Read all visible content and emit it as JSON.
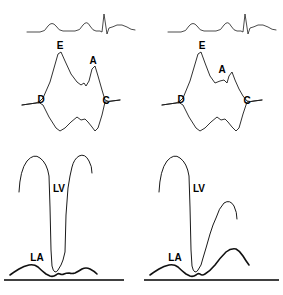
{
  "figure": {
    "background_color": "#ffffff",
    "trace_color": "#1a1a1a",
    "baseline_color": "#000000",
    "width": 283,
    "height": 295
  },
  "panels": [
    {
      "id": "top-left",
      "name": "mitral-m-mode-left",
      "description": "ECG with mitral valve M-mode tracing, normal pattern",
      "labels": [
        {
          "text": "E",
          "x": 60,
          "y": 46
        },
        {
          "text": "A",
          "x": 93,
          "y": 61
        },
        {
          "text": "D",
          "x": 41,
          "y": 100
        },
        {
          "text": "C",
          "x": 106,
          "y": 101
        }
      ]
    },
    {
      "id": "top-right",
      "name": "mitral-m-mode-right",
      "description": "ECG with mitral valve M-mode tracing, abnormal pattern",
      "labels": [
        {
          "text": "E",
          "x": 202,
          "y": 46
        },
        {
          "text": "A",
          "x": 222,
          "y": 70
        },
        {
          "text": "D",
          "x": 181,
          "y": 100
        },
        {
          "text": "C",
          "x": 247,
          "y": 101
        }
      ]
    },
    {
      "id": "bottom-left",
      "name": "pressure-tracing-left",
      "description": "LV and LA pressure tracings, normal LA pressure",
      "labels": [
        {
          "text": "LV",
          "x": 59,
          "y": 189
        },
        {
          "text": "LA",
          "x": 37,
          "y": 258
        }
      ]
    },
    {
      "id": "bottom-right",
      "name": "pressure-tracing-right",
      "description": "LV and LA pressure tracings, elevated LA v wave",
      "labels": [
        {
          "text": "LV",
          "x": 199,
          "y": 189
        },
        {
          "text": "LA",
          "x": 175,
          "y": 258
        }
      ]
    }
  ],
  "chart_data": {
    "type": "line",
    "xlabel": "",
    "ylabel": "",
    "grid": false,
    "legend": "none",
    "panel_count": 4,
    "series": [
      {
        "name": "ecg-left",
        "panel": "top-left",
        "description": "Surface ECG: P wave, second P wave, QRS spike, T wave",
        "path": "M 27,32 L 40,32 Q 45,32 48,26 Q 52,21 56,26 Q 59,31 63,31 L 75,31 Q 80,31 83,25 Q 87,20 90,26 Q 93,31 96,31 L 100,31 L 102,32 L 104,14 L 107,34 L 109,28 Q 113,27 117,25 Q 122,24 127,27 Q 131,30 135,30"
      },
      {
        "name": "mitral-anterior-leaflet-left",
        "panel": "top-left",
        "description": "Anterior mitral leaflet M-mode: D, E, F, A, C points (normal, wide EF slope)",
        "path": "M 22,105 L 36,103 Q 40,102 43,98 L 50,82 L 58,54 L 61,52 L 65,61 L 71,74 L 77,82 L 81,85 L 84,83 L 86,86 L 89,81 L 92,69 L 95,66 L 98,76 L 102,90 L 105,100 Q 108,102 112,101 L 120,100"
      },
      {
        "name": "mitral-posterior-leaflet-left",
        "panel": "top-left",
        "description": "Posterior mitral leaflet M-mode, mirror image",
        "path": "M 22,105 L 36,103 Q 40,102 43,105 L 49,117 L 56,128 L 60,131 L 65,128 L 71,122 L 77,117 L 81,120 L 85,119 L 88,122 L 92,127 L 95,131 L 98,128 L 102,115 L 105,102 Q 108,102 112,101 L 120,100"
      },
      {
        "name": "ecg-right",
        "panel": "top-right",
        "description": "Surface ECG: P wave, second P wave, QRS spike, T wave",
        "path": "M 168,32 L 181,32 Q 186,32 189,26 Q 193,21 197,26 Q 200,31 204,31 L 216,31 Q 221,31 224,25 Q 228,20 231,26 Q 234,31 237,31 L 241,31 L 243,32 L 245,14 L 248,34 L 250,28 Q 254,27 258,25 Q 263,24 268,27 Q 272,30 276,30"
      },
      {
        "name": "mitral-anterior-leaflet-right",
        "panel": "top-right",
        "description": "Anterior mitral leaflet M-mode: D, E, F, A, C points (abnormal, flattened EF slope)",
        "path": "M 162,105 L 176,103 Q 180,102 183,98 L 190,81 L 198,54 L 201,52 L 205,63 L 210,76 L 215,83 L 220,81 L 224,80 L 227,83 L 229,76 L 232,72 L 235,80 L 239,89 L 243,96 L 247,101 Q 250,102 254,101 L 262,100"
      },
      {
        "name": "mitral-posterior-leaflet-right",
        "panel": "top-right",
        "description": "Posterior mitral leaflet M-mode, mirror image",
        "path": "M 162,105 L 176,103 Q 180,102 183,105 L 189,117 L 196,128 L 200,131 L 205,128 L 211,122 L 217,117 L 221,120 L 225,119 L 228,122 L 232,127 L 236,131 L 239,128 L 243,114 L 247,102 Q 250,102 254,101 L 262,100"
      },
      {
        "name": "lv-pressure-left",
        "panel": "bottom-left",
        "description": "Left ventricular pressure tracing, normal",
        "path": "M 19,192 Q 20,170 27,161 Q 34,153 40,158 Q 47,163 49,176 L 50,207 L 51,250 L 52,266 Q 53,271 55,272 Q 57,272 58,270 L 61,265 L 63,260 L 65,252 L 66,215 L 68,188 L 70,176 L 72,167 Q 74,159 79,156 Q 85,153 89,161 Q 92,166 92,173"
      },
      {
        "name": "la-pressure-left",
        "panel": "bottom-left",
        "description": "Left atrial pressure tracing, normal low pressure with small a and v waves",
        "path": "M 10,275 Q 14,272 19,269 Q 24,266 29,265 Q 34,264 38,267 Q 42,271 46,274 L 50,276 Q 53,277 56,275 Q 58,273 60,274 Q 62,275 64,274 Q 66,273 69,273 Q 72,274 75,273 Q 79,271 82,269 Q 86,267 90,269 Q 94,271 97,274"
      },
      {
        "name": "baseline-left",
        "panel": "bottom-left",
        "description": "Zero pressure baseline",
        "path": "M 4,280 L 124,280"
      },
      {
        "name": "lv-pressure-right",
        "panel": "bottom-right",
        "description": "Left ventricular pressure tracing",
        "path": "M 159,192 Q 160,170 167,161 Q 174,153 180,158 Q 187,163 189,176 L 190,207 L 191,250 L 192,266 Q 193,271 195,272 Q 197,272 198,270 L 201,265 L 203,258 L 206,248 L 210,234 L 213,225 L 216,218 Q 219,208 224,203 Q 230,199 234,206 Q 237,212 237,219"
      },
      {
        "name": "la-pressure-right",
        "panel": "bottom-right",
        "description": "Left atrial pressure tracing with large v wave merging into LV downslope",
        "path": "M 150,275 Q 154,272 159,269 Q 164,266 169,265 Q 174,264 178,267 Q 182,271 186,274 L 190,276 Q 193,277 196,275 Q 198,273 200,274 Q 202,276 205,274 Q 210,271 215,265 Q 220,258 226,252 Q 231,248 236,249 Q 240,251 243,256 Q 246,261 249,265"
      },
      {
        "name": "baseline-right",
        "panel": "bottom-right",
        "description": "Zero pressure baseline",
        "path": "M 144,280 L 279,280"
      }
    ]
  }
}
